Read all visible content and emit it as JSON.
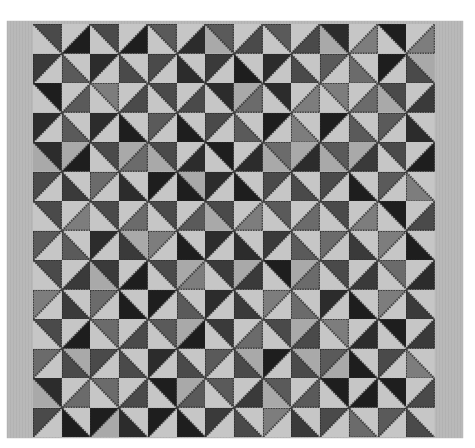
{
  "image": {
    "subject": "Pieced pinwheel quilt photographed flat in black and white",
    "grid": {
      "rows": 14,
      "cols": 14
    },
    "colors": {
      "background": "#ffffff",
      "border": "#b9b9b9",
      "light_triangle": "#c6c6c6",
      "dark_shades": [
        "#1e1e1e",
        "#2c2c2c",
        "#3a3a3a",
        "#4a4a4a",
        "#5a5a5a",
        "#6b6b6b",
        "#7d7d7d"
      ],
      "sawtooth_edge": "#2a2a2a"
    }
  }
}
